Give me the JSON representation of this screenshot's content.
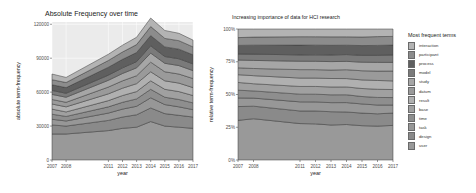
{
  "chart_data": [
    {
      "type": "area",
      "stacked": true,
      "title": "Absolute Frequency over time",
      "xlabel": "year",
      "ylabel": "absolute term-frequency",
      "x": [
        2007,
        2008,
        2011,
        2012,
        2013,
        2014,
        2015,
        2016,
        2017
      ],
      "xticks": [
        "2007",
        "2008",
        "2011",
        "2012",
        "2013",
        "2014",
        "2015",
        "2016",
        "2017"
      ],
      "yticks": [
        "0",
        "30000",
        "60000",
        "90000",
        "120000"
      ],
      "ylim": [
        0,
        122000
      ],
      "grid": true,
      "series": [
        {
          "name": "user",
          "values": [
            23000,
            23000,
            26000,
            28000,
            29000,
            34000,
            30000,
            29000,
            28000
          ]
        },
        {
          "name": "design",
          "values": [
            8000,
            7000,
            9000,
            10000,
            11000,
            12000,
            11000,
            10500,
            10000
          ]
        },
        {
          "name": "task",
          "values": [
            5000,
            4500,
            6500,
            7000,
            7500,
            9000,
            8000,
            7500,
            6500
          ]
        },
        {
          "name": "time",
          "values": [
            4500,
            4000,
            5500,
            6000,
            6500,
            7500,
            6500,
            6500,
            6000
          ]
        },
        {
          "name": "base",
          "values": [
            4500,
            4000,
            5500,
            6000,
            6500,
            7500,
            7000,
            7000,
            6500
          ]
        },
        {
          "name": "result",
          "values": [
            4500,
            4500,
            6000,
            6500,
            7000,
            8000,
            7500,
            7500,
            7000
          ]
        },
        {
          "name": "datum",
          "values": [
            4000,
            4000,
            6000,
            6500,
            7000,
            8500,
            8000,
            8000,
            8000
          ]
        },
        {
          "name": "study",
          "values": [
            4500,
            4500,
            6000,
            6500,
            7000,
            8000,
            7500,
            7500,
            7000
          ]
        },
        {
          "name": "model",
          "values": [
            3500,
            3500,
            4500,
            5000,
            5500,
            6500,
            6000,
            6000,
            6000
          ]
        },
        {
          "name": "process",
          "values": [
            5000,
            5000,
            7000,
            7500,
            8000,
            9000,
            8500,
            8500,
            8000
          ]
        },
        {
          "name": "participant",
          "values": [
            4500,
            4500,
            6000,
            6500,
            7000,
            8000,
            7500,
            7500,
            7000
          ]
        },
        {
          "name": "interaction",
          "values": [
            5000,
            4500,
            5500,
            6000,
            6500,
            7500,
            7000,
            6500,
            6000
          ]
        }
      ]
    },
    {
      "type": "area",
      "stacked": true,
      "normalized": true,
      "title": "Increasing importance of data for HCI research",
      "xlabel": "year",
      "ylabel": "relative term-frequency",
      "x": [
        2007,
        2008,
        2011,
        2012,
        2013,
        2014,
        2015,
        2016,
        2017
      ],
      "xticks": [
        "2007",
        "2008",
        "2011",
        "2012",
        "2013",
        "2014",
        "2015",
        "2016",
        "2017"
      ],
      "yticks": [
        "0%",
        "25%",
        "50%",
        "75%",
        "100%"
      ],
      "ylim": [
        0,
        1
      ],
      "grid": true,
      "legend": {
        "title": "Most frequent terms",
        "position": "right",
        "entries": [
          "interaction",
          "participant",
          "process",
          "model",
          "study",
          "datum",
          "result",
          "base",
          "time",
          "task",
          "design",
          "user"
        ]
      }
    }
  ],
  "left_chart": {
    "title": "Absolute Frequency over time",
    "ylabel": "absolute term-frequency",
    "xlabel": "year",
    "yticks": [
      "0",
      "30000",
      "60000",
      "90000",
      "120000"
    ],
    "xticks": [
      "2007",
      "2008",
      "2011",
      "2012",
      "2013",
      "2014",
      "2015",
      "2016",
      "2017"
    ]
  },
  "right_chart": {
    "title": "Increasing importance of data for HCI research",
    "ylabel": "relative term-frequency",
    "xlabel": "year",
    "yticks": [
      "0%",
      "25%",
      "50%",
      "75%",
      "100%"
    ],
    "xticks": [
      "2007",
      "2008",
      "2011",
      "2012",
      "2013",
      "2014",
      "2015",
      "2016",
      "2017"
    ]
  },
  "legend": {
    "title": "Most frequent terms",
    "items": [
      {
        "label": "interaction",
        "color": "#b3b3b3"
      },
      {
        "label": "participant",
        "color": "#8c8c8c"
      },
      {
        "label": "process",
        "color": "#5f5f5f"
      },
      {
        "label": "model",
        "color": "#7a7a7a"
      },
      {
        "label": "study",
        "color": "#a6a6a6"
      },
      {
        "label": "datum",
        "color": "#9a9a9a"
      },
      {
        "label": "result",
        "color": "#b0b0b0"
      },
      {
        "label": "base",
        "color": "#a0a0a0"
      },
      {
        "label": "time",
        "color": "#8e8e8e"
      },
      {
        "label": "task",
        "color": "#979797"
      },
      {
        "label": "design",
        "color": "#8a8a8a"
      },
      {
        "label": "user",
        "color": "#999999"
      }
    ]
  }
}
